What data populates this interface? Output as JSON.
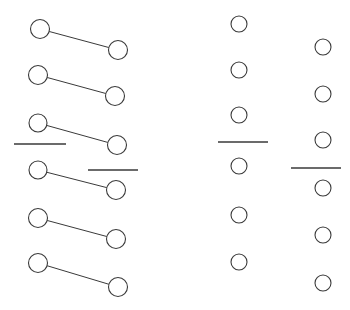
{
  "figure": {
    "title": "",
    "width": 350,
    "height": 310,
    "background_color": "#ffffff",
    "stroke_color": "#3a3a3a",
    "node_fill_color": "#ffffff",
    "node_stroke_width": 1.1,
    "link_stroke_width": 1.0,
    "bar_stroke_width": 1.6,
    "groups": [
      {
        "name": "left-linked-pairs",
        "kind": "linked-pairs",
        "count": 6,
        "items": [
          {
            "x1": 40,
            "y1": 29,
            "r1": 9.5,
            "x2": 118,
            "y2": 50,
            "r2": 9.5
          },
          {
            "x1": 38,
            "y1": 75,
            "r1": 9.5,
            "x2": 115,
            "y2": 96,
            "r2": 9.5
          },
          {
            "x1": 38,
            "y1": 123,
            "r1": 9.0,
            "x2": 117,
            "y2": 145,
            "r2": 9.5
          },
          {
            "x1": 38,
            "y1": 170,
            "r1": 9.0,
            "x2": 116,
            "y2": 190,
            "r2": 9.5
          },
          {
            "x1": 38,
            "y1": 218,
            "r1": 9.5,
            "x2": 116,
            "y2": 239,
            "r2": 9.5
          },
          {
            "x1": 38,
            "y1": 263,
            "r1": 9.5,
            "x2": 118,
            "y2": 287,
            "r2": 9.5
          }
        ]
      },
      {
        "name": "middle-nodes",
        "kind": "nodes",
        "count": 6,
        "items": [
          {
            "cx": 239,
            "cy": 24,
            "r": 8.0
          },
          {
            "cx": 239,
            "cy": 70,
            "r": 8.0
          },
          {
            "cx": 239,
            "cy": 115,
            "r": 8.0
          },
          {
            "cx": 239,
            "cy": 166,
            "r": 8.0
          },
          {
            "cx": 239,
            "cy": 215,
            "r": 8.0
          },
          {
            "cx": 239,
            "cy": 262,
            "r": 8.0
          }
        ]
      },
      {
        "name": "right-nodes",
        "kind": "nodes",
        "count": 6,
        "items": [
          {
            "cx": 323,
            "cy": 47,
            "r": 8.0
          },
          {
            "cx": 323,
            "cy": 94,
            "r": 8.0
          },
          {
            "cx": 323,
            "cy": 140,
            "r": 8.0
          },
          {
            "cx": 323,
            "cy": 188,
            "r": 8.0
          },
          {
            "cx": 323,
            "cy": 235,
            "r": 8.0
          },
          {
            "cx": 323,
            "cy": 283,
            "r": 8.0
          }
        ]
      },
      {
        "name": "bar-segments",
        "kind": "horizontal-segments",
        "count": 4,
        "items": [
          {
            "x1": 14,
            "x2": 66,
            "y": 144
          },
          {
            "x1": 88,
            "x2": 138,
            "y": 170
          },
          {
            "x1": 218,
            "x2": 268,
            "y": 142
          },
          {
            "x1": 291,
            "x2": 341,
            "y": 168
          }
        ]
      }
    ]
  }
}
